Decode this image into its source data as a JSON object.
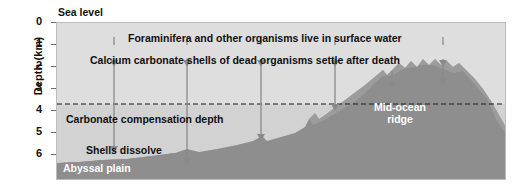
{
  "diagram": {
    "axis": {
      "title": "Depth (km)",
      "ticks": [
        {
          "value": "0",
          "y": 22
        },
        {
          "value": "1",
          "y": 43
        },
        {
          "value": "2",
          "y": 65
        },
        {
          "value": "3",
          "y": 87
        },
        {
          "value": "4",
          "y": 109
        },
        {
          "value": "5",
          "y": 131
        },
        {
          "value": "6",
          "y": 153
        }
      ],
      "unit": "km",
      "range": [
        0,
        6
      ]
    },
    "labels": {
      "sea_level": "Sea level",
      "surface_organisms": "Foraminifera and other organisms live in surface water",
      "settling": "Calcium carbonate shells of dead organisms settle after death",
      "ccd": "Carbonate compensation depth",
      "dissolve": "Shells  dissolve",
      "abyssal_plain": "Abyssal plain",
      "mid_ocean_ridge_line1": "Mid-ocean",
      "mid_ocean_ridge_line2": "ridge",
      "carbonate_sediment": "Carbonate sediment"
    },
    "ccd_depth_km": 3.6,
    "arrows": [
      {
        "x": 113,
        "top": 36,
        "bottom": 148
      },
      {
        "x": 186,
        "top": 36,
        "bottom": 160
      },
      {
        "x": 260,
        "top": 36,
        "bottom": 131
      },
      {
        "x": 334,
        "top": 36,
        "bottom": 104
      },
      {
        "x": 442,
        "top": 36,
        "bottom": 104
      }
    ],
    "short_arrows": [
      {
        "x": 391,
        "top": 88,
        "bottom": 108
      },
      {
        "x": 442,
        "top": 88,
        "bottom": 108
      }
    ],
    "colors": {
      "water": "#dedede",
      "seafloor": "#8e8e8e",
      "sediment_top": "#a8a8a8",
      "arrow": "#8a8a8a",
      "text": "#111111",
      "white_text": "#ffffff"
    }
  }
}
